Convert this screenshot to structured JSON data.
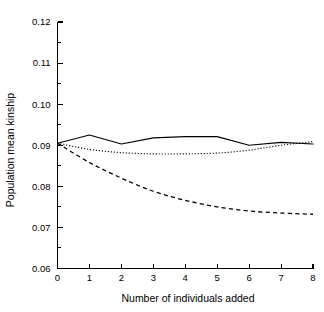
{
  "chart_data": {
    "type": "line",
    "title": "",
    "subtitle": "",
    "xlabel": "Number of individuals added",
    "ylabel": "Population mean kinship",
    "xlim": [
      0,
      8
    ],
    "ylim": [
      0.06,
      0.12
    ],
    "grid": false,
    "legend": "none",
    "x_ticks": [
      "0",
      "1",
      "2",
      "3",
      "4",
      "5",
      "6",
      "7",
      "8"
    ],
    "x_tick_values": [
      0,
      1,
      2,
      3,
      4,
      5,
      6,
      7,
      8
    ],
    "y_ticks": [
      "0.12",
      "0.11",
      "0.10",
      "0.09",
      "0.08",
      "0.07",
      "0.06"
    ],
    "y_tick_values": [
      0.12,
      0.11,
      0.1,
      0.09,
      0.08,
      0.07,
      0.06
    ],
    "y_minor_tick_values": [
      0.115,
      0.105,
      0.095,
      0.085,
      0.075,
      0.065
    ],
    "x": [
      0,
      1,
      2,
      3,
      4,
      5,
      6,
      7,
      8
    ],
    "series": [
      {
        "name": "solid-line",
        "style": "solid",
        "color": "#000000",
        "values": [
          0.0905,
          0.0925,
          0.0903,
          0.0918,
          0.0921,
          0.0921,
          0.09,
          0.0907,
          0.0903
        ]
      },
      {
        "name": "dotted-line",
        "style": "dotted",
        "color": "#000000",
        "values": [
          0.0905,
          0.089,
          0.0882,
          0.0879,
          0.0879,
          0.0881,
          0.0888,
          0.09,
          0.0909
        ]
      },
      {
        "name": "dashed-line",
        "style": "dashed",
        "color": "#000000",
        "values": [
          0.0905,
          0.0858,
          0.082,
          0.0788,
          0.0766,
          0.075,
          0.074,
          0.0735,
          0.0732
        ]
      }
    ]
  },
  "axes": {
    "y_axis_title": "Population mean kinship",
    "x_axis_title": "Number of individuals added"
  },
  "colors": {
    "ink": "#000000",
    "background": "#ffffff"
  }
}
